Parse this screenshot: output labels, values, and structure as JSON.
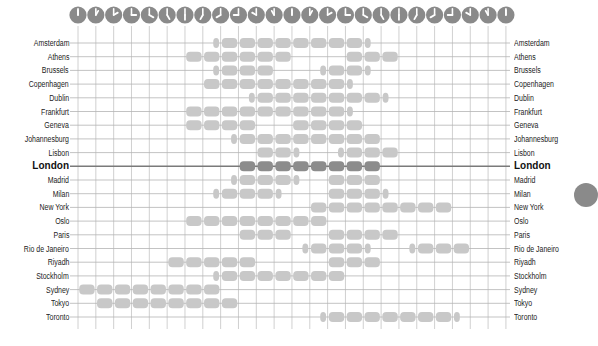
{
  "chart_data": {
    "type": "timeline",
    "title": "",
    "xlabel": "Hour of day (clock icons)",
    "ylabel": "",
    "hours": [
      0,
      1,
      2,
      3,
      4,
      5,
      6,
      7,
      8,
      9,
      10,
      11,
      12,
      13,
      14,
      15,
      16,
      17,
      18,
      19,
      20,
      21,
      22,
      23,
      24
    ],
    "clock_hour_hands": [
      12,
      1,
      2,
      3,
      4,
      5,
      6,
      7,
      8,
      9,
      10,
      11,
      12,
      1,
      2,
      3,
      4,
      5,
      6,
      7,
      8,
      9,
      10,
      11,
      12
    ],
    "highlight_city": "London",
    "grid": true,
    "colors": {
      "bar": "#c8c8c8",
      "bar_highlight": "#8c8c8c",
      "line": "#b4b4b4",
      "line_highlight": "#7a7a7a",
      "clock": "#8a8a8a",
      "text": "#222222"
    },
    "rows": [
      {
        "city": "Amsterdam",
        "segments": [
          [
            7.5,
            16.5
          ]
        ]
      },
      {
        "city": "Athens",
        "segments": [
          [
            6,
            12
          ],
          [
            15,
            18
          ]
        ]
      },
      {
        "city": "Brussels",
        "segments": [
          [
            7.5,
            11
          ],
          [
            13.5,
            16.5
          ]
        ]
      },
      {
        "city": "Copenhagen",
        "segments": [
          [
            7,
            15.5
          ]
        ]
      },
      {
        "city": "Dublin",
        "segments": [
          [
            9.5,
            17.5
          ]
        ]
      },
      {
        "city": "Frankfurt",
        "segments": [
          [
            6,
            15.5
          ]
        ]
      },
      {
        "city": "Geneva",
        "segments": [
          [
            6,
            10
          ],
          [
            12,
            16
          ]
        ]
      },
      {
        "city": "Johannesburg",
        "segments": [
          [
            8.5,
            17
          ]
        ]
      },
      {
        "city": "Lisbon",
        "segments": [
          [
            10,
            12.5
          ],
          [
            14.5,
            18
          ]
        ]
      },
      {
        "city": "London",
        "segments": [
          [
            9,
            17
          ]
        ]
      },
      {
        "city": "Madrid",
        "segments": [
          [
            8.5,
            12.5
          ],
          [
            14,
            17
          ]
        ]
      },
      {
        "city": "Milan",
        "segments": [
          [
            7.5,
            11.5
          ],
          [
            14,
            17.5
          ]
        ]
      },
      {
        "city": "New York",
        "segments": [
          [
            13,
            21
          ]
        ]
      },
      {
        "city": "Oslo",
        "segments": [
          [
            6,
            14
          ]
        ]
      },
      {
        "city": "Paris",
        "segments": [
          [
            9,
            12
          ],
          [
            14,
            18
          ]
        ]
      },
      {
        "city": "Rio de Janeiro",
        "segments": [
          [
            12.5,
            16.5
          ],
          [
            18.5,
            22
          ]
        ]
      },
      {
        "city": "Riyadh",
        "segments": [
          [
            5,
            10
          ],
          [
            14,
            17
          ]
        ]
      },
      {
        "city": "Stockholm",
        "segments": [
          [
            7.5,
            15
          ]
        ]
      },
      {
        "city": "Sydney",
        "segments": [
          [
            0,
            8
          ]
        ]
      },
      {
        "city": "Tokyo",
        "segments": [
          [
            1,
            9
          ]
        ]
      },
      {
        "city": "Toronto",
        "segments": [
          [
            13.5,
            21.5
          ]
        ]
      }
    ]
  }
}
